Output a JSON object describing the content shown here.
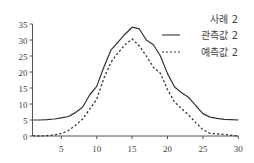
{
  "chart_data": {
    "type": "line",
    "title": "사례 2",
    "xlabel": "",
    "ylabel": "",
    "xlim": [
      1,
      30
    ],
    "ylim": [
      0,
      35
    ],
    "xticks": [
      5,
      10,
      15,
      20,
      25,
      30
    ],
    "yticks": [
      0,
      5,
      10,
      15,
      20,
      25,
      30,
      35
    ],
    "grid": false,
    "legend_position": "upper right",
    "x": [
      1,
      2,
      3,
      4,
      5,
      6,
      7,
      8,
      9,
      10,
      11,
      12,
      13,
      14,
      15,
      16,
      17,
      18,
      19,
      20,
      21,
      22,
      23,
      24,
      25,
      26,
      27,
      28,
      29,
      30
    ],
    "series": [
      {
        "name": "관측값 2",
        "style": "solid",
        "values": [
          5,
          5,
          5.1,
          5.3,
          5.7,
          6.1,
          7.3,
          9,
          12.8,
          15.5,
          21.5,
          26.8,
          29.3,
          31.8,
          34,
          33.5,
          30,
          28.5,
          25,
          19.5,
          15.3,
          13.5,
          12,
          9.5,
          7,
          5.9,
          5.5,
          5.2,
          5.1,
          5
        ]
      },
      {
        "name": "예측값 2",
        "style": "dotted",
        "values": [
          0.1,
          0,
          0.1,
          0.3,
          0.8,
          1.7,
          3.3,
          5.3,
          8.3,
          11.5,
          18,
          23,
          26,
          28.5,
          30.3,
          28.2,
          25,
          21.5,
          19.6,
          14.5,
          10.6,
          8.5,
          6.5,
          4.2,
          2,
          0.8,
          0.7,
          0.5,
          0.2,
          0
        ]
      }
    ]
  },
  "legend": {
    "title": "사례 2",
    "items": [
      {
        "label": "관측값 2",
        "style": "solid"
      },
      {
        "label": "예측값 2",
        "style": "dotted"
      }
    ]
  },
  "colors": {
    "line": "#333333",
    "axis": "#555555",
    "text": "#444444"
  }
}
